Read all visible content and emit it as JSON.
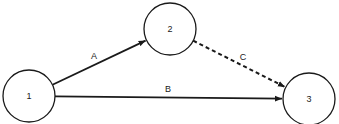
{
  "diagram": {
    "type": "network-graph",
    "colors": {
      "stroke": "#1a1a1a",
      "background": "#ffffff"
    },
    "nodes": [
      {
        "id": "1",
        "label": "1",
        "cx": 29,
        "cy": 96,
        "r": 26
      },
      {
        "id": "2",
        "label": "2",
        "cx": 170,
        "cy": 29,
        "r": 26
      },
      {
        "id": "3",
        "label": "3",
        "cx": 309,
        "cy": 99,
        "r": 26
      }
    ],
    "edges": [
      {
        "id": "A",
        "label": "A",
        "from": "1",
        "to": "2",
        "style": "solid",
        "label_x": 94,
        "label_y": 59
      },
      {
        "id": "B",
        "label": "B",
        "from": "1",
        "to": "3",
        "style": "solid",
        "label_x": 168,
        "label_y": 92
      },
      {
        "id": "C",
        "label": "C",
        "from": "2",
        "to": "3",
        "style": "dashed",
        "label_x": 243,
        "label_y": 60
      }
    ]
  }
}
